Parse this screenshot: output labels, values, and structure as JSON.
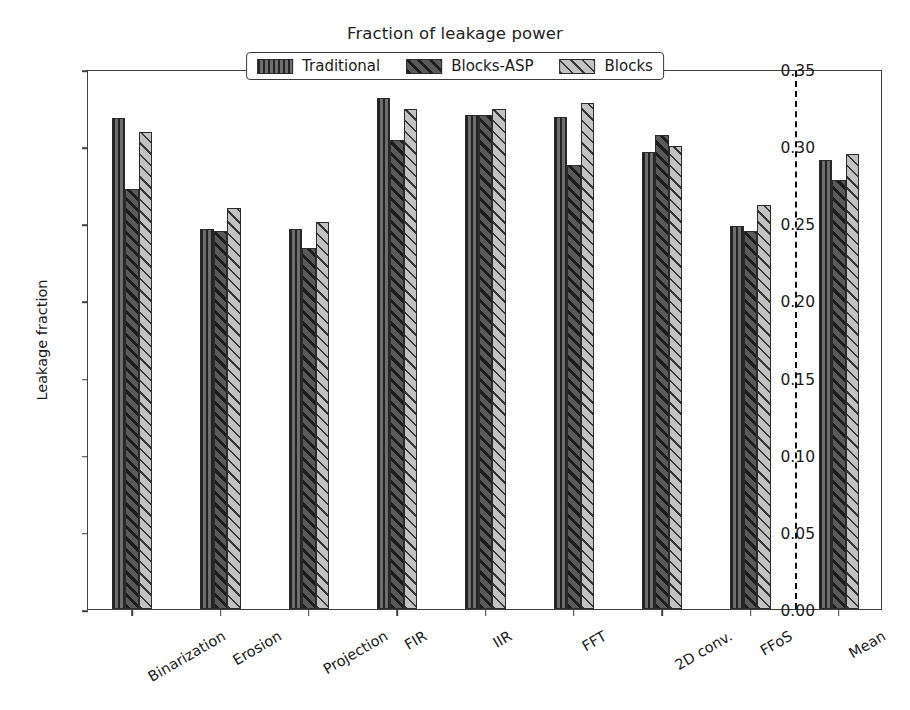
{
  "chart_data": {
    "type": "bar",
    "title": "Fraction of leakage power",
    "xlabel": "",
    "ylabel": "Leakage fraction",
    "ylim": [
      0.0,
      0.35
    ],
    "yticks": [
      "0.00",
      "0.05",
      "0.10",
      "0.15",
      "0.20",
      "0.25",
      "0.30",
      "0.35"
    ],
    "ytick_values": [
      0.0,
      0.05,
      0.1,
      0.15,
      0.2,
      0.25,
      0.3,
      0.35
    ],
    "grid": false,
    "legend_position": "upper center",
    "categories": [
      "Binarization",
      "Erosion",
      "Projection",
      "FIR",
      "IIR",
      "FFT",
      "2D conv.",
      "FFoS",
      "Mean"
    ],
    "series": [
      {
        "name": "Traditional",
        "pattern": "vertical-hatch",
        "color": "#6e6e6e",
        "values": [
          0.318,
          0.246,
          0.246,
          0.331,
          0.32,
          0.319,
          0.296,
          0.248,
          0.291
        ]
      },
      {
        "name": "Blocks-ASP",
        "pattern": "dense-diagonal-hatch",
        "color": "#5a5a5a",
        "values": [
          0.272,
          0.245,
          0.234,
          0.304,
          0.32,
          0.288,
          0.307,
          0.245,
          0.278
        ]
      },
      {
        "name": "Blocks",
        "pattern": "light-diagonal-hatch",
        "color": "#c2c2c2",
        "values": [
          0.309,
          0.26,
          0.251,
          0.324,
          0.324,
          0.328,
          0.3,
          0.262,
          0.295
        ]
      }
    ],
    "annotations": [
      {
        "type": "vertical-dashed-line",
        "after_category": "FFoS",
        "note": "separates benchmarks from Mean"
      }
    ]
  },
  "legend": {
    "items": [
      {
        "label": "Traditional"
      },
      {
        "label": "Blocks-ASP"
      },
      {
        "label": "Blocks"
      }
    ]
  }
}
